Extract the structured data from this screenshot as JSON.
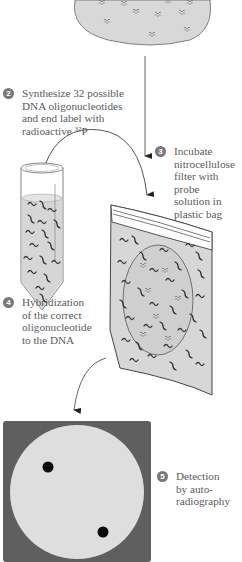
{
  "diagram": {
    "type": "process-flow",
    "topic": "Screening a DNA library with labeled oligonucleotide probes",
    "colors": {
      "filter_fill": "#d8d8d8",
      "outline": "#666666",
      "probe_strand": "#3a3a3a",
      "film_frame": "#5f5f5f",
      "film_disc": "#dedede",
      "spot": "#0a0a0a",
      "step_badge": "#77777c",
      "text": "#5a5a60"
    },
    "steps": [
      {
        "number": "2",
        "line1": "Synthesize 32 possible",
        "line2": "DNA oligonucleotides",
        "line3": "and end label with",
        "line4_prefix": "radioactive ",
        "line4_sup": "32",
        "line4_suffix": "P"
      },
      {
        "number": "3",
        "text": "Incubate\nnitrocellulose\nfilter with probe\nsolution in\nplastic bag"
      },
      {
        "number": "4",
        "text": "Hybridization\nof the correct\noligonucleotide\nto the DNA"
      },
      {
        "number": "5",
        "text": "Detection\nby auto-\nradiography"
      }
    ],
    "elements": [
      {
        "id": "filter-disc",
        "label": "Nitrocellulose filter with DNA colonies (partial, top)"
      },
      {
        "id": "probe-tube",
        "label": "Tube of labeled oligonucleotide probes"
      },
      {
        "id": "plastic-bag",
        "label": "Filter in sealed plastic bag with probe solution"
      },
      {
        "id": "autoradiograph",
        "label": "X-ray film with two dark spots",
        "spot_count": 2
      }
    ]
  }
}
